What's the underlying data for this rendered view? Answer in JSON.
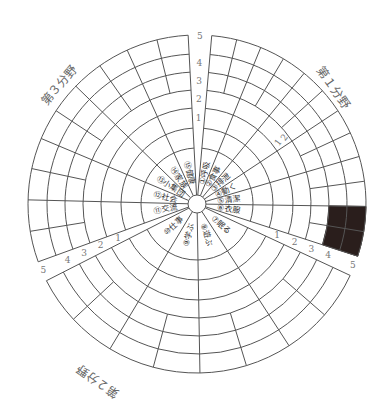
{
  "diagram": {
    "center": [
      197,
      204
    ],
    "hub_radius": 9,
    "ring_radii": [
      56,
      76,
      96,
      114,
      132,
      150,
      169
    ],
    "scale_labels": [
      "1",
      "2",
      "3",
      "4",
      "5"
    ],
    "fields": [
      {
        "title": "第１分野",
        "start_deg": 85,
        "end_deg": -18,
        "title_pos": [
          330,
          90
        ],
        "title_rot": 55,
        "items": [
          {
            "label": "①呼吸"
          },
          {
            "label": "②食事"
          },
          {
            "label": "③排泄"
          },
          {
            "label": "④動く"
          },
          {
            "label": "⑤清潔"
          },
          {
            "label": "⑥衣服"
          }
        ]
      },
      {
        "title": "第２分野",
        "start_deg": -25,
        "end_deg": -153,
        "title_pos": [
          100,
          378
        ],
        "title_rot": 215,
        "items": [
          {
            "label": "⑦眠る"
          },
          {
            "label": "⑧遊ぶ"
          },
          {
            "label": "⑨学ぶ"
          },
          {
            "label": "⑩仕事"
          }
        ]
      },
      {
        "title": "第３分野",
        "start_deg": -160,
        "end_deg": -267,
        "title_pos": [
          62,
          88
        ],
        "title_rot": -50,
        "items": [
          {
            "label": "⑪交流"
          },
          {
            "label": "⑫社会"
          },
          {
            "label": "⑬小集団"
          },
          {
            "label": "⑭家族"
          },
          {
            "label": "⑮健康"
          }
        ]
      }
    ],
    "gaps": [
      {
        "name": "top",
        "mid_deg": 89
      },
      {
        "name": "lower-right",
        "mid_deg": -21.5
      },
      {
        "name": "lower-left",
        "mid_deg": -156.5
      }
    ],
    "filled_cell": {
      "field": 0,
      "item_index": 5,
      "from_ring": 4,
      "to_ring": 6
    },
    "small_marks": [
      "1",
      "2"
    ]
  }
}
